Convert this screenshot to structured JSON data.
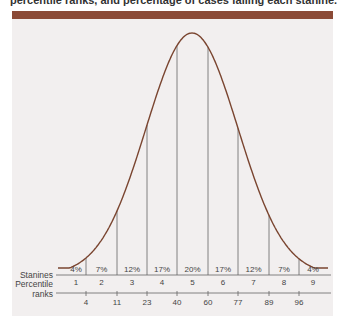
{
  "caption": "percentile ranks, and percentage of cases falling each stanine.",
  "colors": {
    "bar": "#8b4a36",
    "panel": "#f2efef",
    "curve": "#7a4530",
    "lines": "#666666"
  },
  "chart_data": {
    "type": "area",
    "row_labels": {
      "stanines": "Stanines",
      "percentile_1": "Percentile",
      "percentile_2": "ranks"
    },
    "stanines": [
      1,
      2,
      3,
      4,
      5,
      6,
      7,
      8,
      9
    ],
    "percentages": [
      "4%",
      "7%",
      "12%",
      "17%",
      "20%",
      "17%",
      "12%",
      "7%",
      "4%"
    ],
    "percentile_ranks": [
      4,
      11,
      23,
      40,
      60,
      77,
      89,
      96
    ],
    "grid": false
  }
}
